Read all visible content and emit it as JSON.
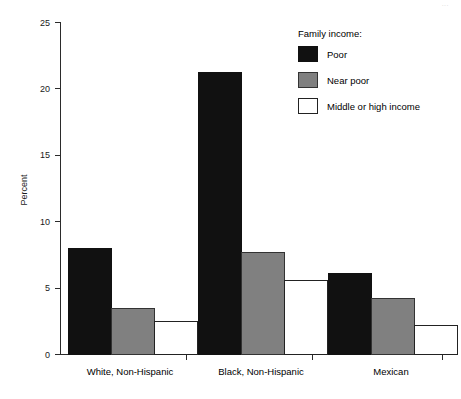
{
  "page": {
    "number": "..."
  },
  "chart_data": {
    "type": "bar",
    "title": "",
    "subtitle": "",
    "xlabel": "",
    "ylabel": "Percent",
    "ylim": [
      0,
      25
    ],
    "yticks": [
      0,
      5,
      10,
      15,
      20,
      25
    ],
    "ytick_labels": [
      "0",
      "5",
      "10",
      "15",
      "20",
      "25"
    ],
    "grid": false,
    "legend_position": "top-right",
    "legend_title": "Family income:",
    "categories": [
      "White, Non-Hispanic",
      "Black, Non-Hispanic",
      "Mexican"
    ],
    "series": [
      {
        "name": "Poor",
        "color": "#111111",
        "border": "#111111",
        "values": [
          8.0,
          21.2,
          6.1
        ]
      },
      {
        "name": "Near poor",
        "color": "#808080",
        "border": "#333333",
        "values": [
          3.5,
          7.7,
          4.2
        ]
      },
      {
        "name": "Middle or high income",
        "color": "#ffffff",
        "border": "#222222",
        "values": [
          2.5,
          5.6,
          2.2
        ]
      }
    ]
  },
  "axes": {
    "y_tick_0": "0",
    "y_tick_1": "5",
    "y_tick_2": "10",
    "y_tick_3": "15",
    "y_tick_4": "20",
    "y_tick_5": "25",
    "y_axis_title": "Percent"
  },
  "categories": {
    "c0": "White, Non-Hispanic",
    "c1": "Black, Non-Hispanic",
    "c2": "Mexican"
  },
  "legend": {
    "title": "Family income:",
    "items": [
      {
        "label": "Poor",
        "swatch": "black-filled-swatch"
      },
      {
        "label": "Near poor",
        "swatch": "gray-filled-swatch"
      },
      {
        "label": "Middle or high income",
        "swatch": "white-outlined-swatch"
      }
    ]
  }
}
